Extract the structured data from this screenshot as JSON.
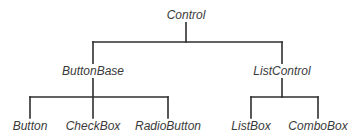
{
  "diagram": {
    "type": "class-hierarchy-tree",
    "line_color": "#2e2e2e",
    "text_color": "#3a3a3a",
    "nodes": {
      "root": {
        "label": "Control"
      },
      "button_base": {
        "label": "ButtonBase"
      },
      "list_control": {
        "label": "ListControl"
      },
      "button": {
        "label": "Button"
      },
      "check_box": {
        "label": "CheckBox"
      },
      "radio_button": {
        "label": "RadioButton"
      },
      "list_box": {
        "label": "ListBox"
      },
      "combo_box": {
        "label": "ComboBox"
      }
    },
    "edges": [
      {
        "from": "Control",
        "to": "ButtonBase"
      },
      {
        "from": "Control",
        "to": "ListControl"
      },
      {
        "from": "ButtonBase",
        "to": "Button"
      },
      {
        "from": "ButtonBase",
        "to": "CheckBox"
      },
      {
        "from": "ButtonBase",
        "to": "RadioButton"
      },
      {
        "from": "ListControl",
        "to": "ListBox"
      },
      {
        "from": "ListControl",
        "to": "ComboBox"
      }
    ]
  }
}
